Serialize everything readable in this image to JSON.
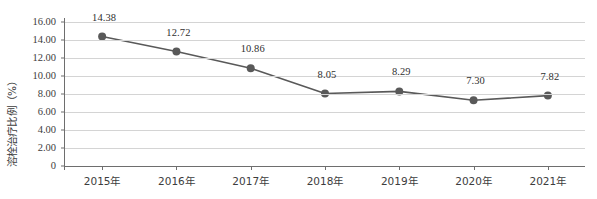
{
  "chart_data": {
    "type": "line",
    "title": "",
    "xlabel": "",
    "ylabel": "溶栓治疗比例（%）",
    "categories": [
      "2015年",
      "2016年",
      "2017年",
      "2018年",
      "2019年",
      "2020年",
      "2021年"
    ],
    "values": [
      14.38,
      12.72,
      10.86,
      8.05,
      8.29,
      7.3,
      7.82
    ],
    "point_labels": [
      "14.38",
      "12.72",
      "10.86",
      "8.05",
      "8.29",
      "7.30",
      "7.82"
    ],
    "ylim": [
      0,
      16
    ],
    "ytick_values": [
      16,
      14,
      12,
      10,
      8,
      6,
      4,
      2,
      0
    ],
    "ytick_labels": [
      "16.00",
      "14.00",
      "12.00",
      "10.00",
      "8.00",
      "6.00",
      "4.00",
      "2.00",
      "0"
    ],
    "grid": true,
    "legend": "none",
    "series": [
      {
        "name": "溶栓治疗比例（%）",
        "values": [
          14.38,
          12.72,
          10.86,
          8.05,
          8.29,
          7.3,
          7.82
        ],
        "line_color": "#595959",
        "marker_color": "#595959",
        "marker": "circle"
      }
    ],
    "colors": {
      "line": "#595959",
      "marker": "#595959",
      "grid": "#d4d4d4",
      "axis": "#6e6e6e",
      "text": "#3d3d3d",
      "background": "#ffffff"
    }
  }
}
